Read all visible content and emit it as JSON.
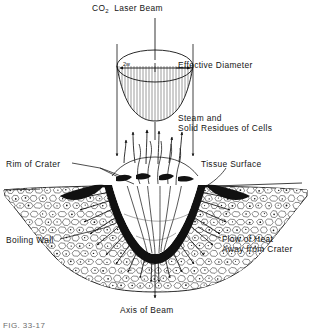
{
  "figure": {
    "caption_fragment": "FIG. 33-17"
  },
  "labels": {
    "co2_beam_prefix": "CO",
    "co2_beam_subscript": "2",
    "co2_beam_suffix": "Laser Beam",
    "co2_beam_full": "CO2 Laser Beam",
    "beam_waist": "2w",
    "effective_diameter": "Effective Diameter",
    "steam_line1": "Steam and",
    "steam_line2": "Solid Residues of Cells",
    "rim_of_crater": "Rim of Crater",
    "tissue_surface": "Tissue Surface",
    "boiling_wall": "Boiling Wall",
    "flow_heat_line1": "Flow of Heat",
    "flow_heat_line2": "Away from Crater",
    "axis_of_beam": "Axis of Beam"
  },
  "colors": {
    "ink": "#111111",
    "paper": "#ffffff",
    "hatch": "#3a3a3a",
    "cell_outline": "#1a1a1a",
    "caption": "#6d6d6d"
  },
  "geometry": {
    "axis_x": 155,
    "beam_edge_left_x": 117,
    "beam_edge_right_x": 193,
    "beam_profile_center_y": 66,
    "tissue_surface_y": 186,
    "crater_bottom_y": 252
  }
}
